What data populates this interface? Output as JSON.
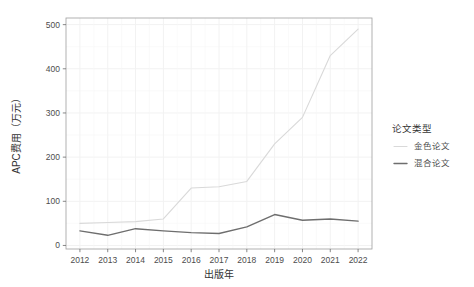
{
  "chart_data": {
    "type": "line",
    "title": "",
    "xlabel": "出版年",
    "ylabel": "APC费用（万元）",
    "x": [
      2012,
      2013,
      2014,
      2015,
      2016,
      2017,
      2018,
      2019,
      2020,
      2021,
      2022
    ],
    "xtick_labels": [
      "2012",
      "2013",
      "2014",
      "2015",
      "2016",
      "2017",
      "2018",
      "2019",
      "2020",
      "2021",
      "2022"
    ],
    "ytick_labels": [
      "0",
      "100",
      "200",
      "300",
      "400",
      "500"
    ],
    "ytick_values": [
      0,
      100,
      200,
      300,
      400,
      500
    ],
    "ylim": [
      -8,
      515
    ],
    "xlim": [
      2011.5,
      2022.5
    ],
    "grid": true,
    "legend_position": "right",
    "legend_title": "论文类型",
    "series": [
      {
        "name": "金色论文",
        "color": "#d9d9d9",
        "values": [
          50,
          52,
          54,
          60,
          130,
          133,
          145,
          230,
          290,
          430,
          490
        ]
      },
      {
        "name": "混合论文",
        "color": "#6e6e6e",
        "values": [
          33,
          23,
          38,
          33,
          29,
          27,
          42,
          70,
          57,
          60,
          55
        ]
      }
    ]
  },
  "legend": {
    "title": "论文类型",
    "items": [
      {
        "label": "金色论文",
        "color": "#d9d9d9"
      },
      {
        "label": "混合论文",
        "color": "#6e6e6e"
      }
    ]
  },
  "axes": {
    "x_title": "出版年",
    "y_title": "APC费用（万元）"
  }
}
